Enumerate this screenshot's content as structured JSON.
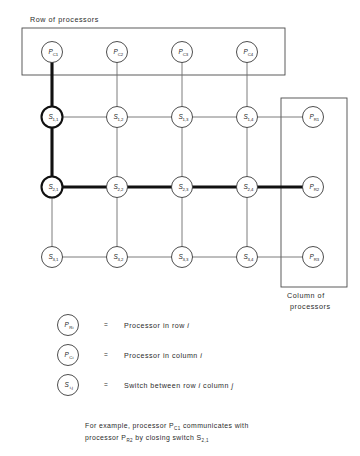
{
  "figure": {
    "title_box_label": "Row of processors",
    "column_box_label_line1": "Column of",
    "column_box_label_line2": "processors"
  },
  "column_processors": [
    {
      "symbol": "P",
      "sub": "C1",
      "x": 52,
      "y": 52
    },
    {
      "symbol": "P",
      "sub": "C2",
      "x": 117,
      "y": 52
    },
    {
      "symbol": "P",
      "sub": "C3",
      "x": 182,
      "y": 52
    },
    {
      "symbol": "P",
      "sub": "C4",
      "x": 247,
      "y": 52
    }
  ],
  "row_processors": [
    {
      "symbol": "P",
      "sub": "R1",
      "x": 313,
      "y": 117
    },
    {
      "symbol": "P",
      "sub": "R2",
      "x": 313,
      "y": 187
    },
    {
      "symbol": "P",
      "sub": "R3",
      "x": 313,
      "y": 257
    }
  ],
  "switches": [
    {
      "symbol": "S",
      "sub": "1,1",
      "x": 52,
      "y": 117,
      "highlighted": true
    },
    {
      "symbol": "S",
      "sub": "1,2",
      "x": 117,
      "y": 117,
      "highlighted": false
    },
    {
      "symbol": "S",
      "sub": "1,3",
      "x": 182,
      "y": 117,
      "highlighted": false
    },
    {
      "symbol": "S",
      "sub": "1,4",
      "x": 247,
      "y": 117,
      "highlighted": false
    },
    {
      "symbol": "S",
      "sub": "2,1",
      "x": 52,
      "y": 187,
      "highlighted": true
    },
    {
      "symbol": "S",
      "sub": "2,2",
      "x": 117,
      "y": 187,
      "highlighted": false
    },
    {
      "symbol": "S",
      "sub": "2,3",
      "x": 182,
      "y": 187,
      "highlighted": false
    },
    {
      "symbol": "S",
      "sub": "2,4",
      "x": 247,
      "y": 187,
      "highlighted": false
    },
    {
      "symbol": "S",
      "sub": "3,1",
      "x": 52,
      "y": 257,
      "highlighted": false
    },
    {
      "symbol": "S",
      "sub": "3,2",
      "x": 117,
      "y": 257,
      "highlighted": false
    },
    {
      "symbol": "S",
      "sub": "3,3",
      "x": 182,
      "y": 257,
      "highlighted": false
    },
    {
      "symbol": "S",
      "sub": "3,4",
      "x": 247,
      "y": 257,
      "highlighted": false
    }
  ],
  "legend": [
    {
      "symbol": "P",
      "sub": "Ri",
      "equals": "=",
      "text_before": "Processor in row ",
      "index": "i",
      "text_after": ""
    },
    {
      "symbol": "P",
      "sub": "Ci",
      "equals": "=",
      "text_before": "Processor in column ",
      "index": "i",
      "text_after": ""
    },
    {
      "symbol": "S",
      "sub": "i,j",
      "equals": "=",
      "text_before": "Switch between row ",
      "index": "i",
      "text_after": " column ",
      "index2": "j"
    }
  ],
  "caption": {
    "line1_a": "For example, processor P",
    "line1_sub": "C1",
    "line1_b": " communicates with",
    "line2_a": "processor P",
    "line2_sub": "R2",
    "line2_b": " by closing switch S",
    "line2_sub2": "2,1"
  },
  "colors": {
    "line": "#6e6e6e",
    "line_bold": "#111111",
    "node_stroke": "#3a3a3a",
    "text": "#2b2b2b",
    "background": "#ffffff"
  }
}
